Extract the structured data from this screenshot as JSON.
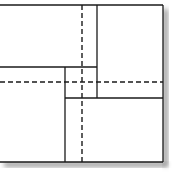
{
  "diagram": {
    "title": "",
    "type": "square-partition",
    "colors": {
      "background": "#ffffff",
      "line": "#1a1a1a",
      "shadow": "#9a9a9a"
    },
    "outer_square": {
      "x": 0,
      "y": 5,
      "width": 163,
      "height": 157
    },
    "solid_lines": [
      {
        "id": "top-edge",
        "x1": 0,
        "y1": 5,
        "x2": 163,
        "y2": 5
      },
      {
        "id": "right-edge",
        "x1": 163,
        "y1": 5,
        "x2": 163,
        "y2": 162
      },
      {
        "id": "bottom-edge",
        "x1": 0,
        "y1": 162,
        "x2": 163,
        "y2": 162
      },
      {
        "id": "upper-vertical",
        "x1": 97,
        "y1": 5,
        "x2": 97,
        "y2": 98
      },
      {
        "id": "left-horizontal",
        "x1": 0,
        "y1": 67,
        "x2": 97,
        "y2": 67
      },
      {
        "id": "lower-vertical",
        "x1": 65,
        "y1": 67,
        "x2": 65,
        "y2": 162
      },
      {
        "id": "right-horizontal",
        "x1": 65,
        "y1": 98,
        "x2": 163,
        "y2": 98
      }
    ],
    "dashed_lines": [
      {
        "id": "vertical-midline",
        "x1": 82,
        "y1": 5,
        "x2": 82,
        "y2": 162
      },
      {
        "id": "horizontal-midline",
        "x1": 0,
        "y1": 82,
        "x2": 163,
        "y2": 82
      }
    ]
  }
}
